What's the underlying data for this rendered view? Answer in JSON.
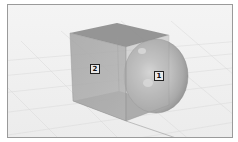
{
  "viewport": {
    "background": "#efefef",
    "grid_color": "#d6d6d6",
    "border_color": "#9a9a9a"
  },
  "objects": [
    {
      "id": "1",
      "type": "sphere",
      "label": "1",
      "color": "#b8b8b8"
    },
    {
      "id": "2",
      "type": "cube",
      "label": "2",
      "color": "#a8a8a8"
    }
  ]
}
